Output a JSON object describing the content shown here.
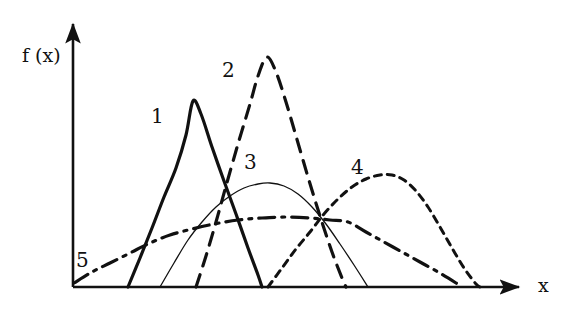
{
  "figure": {
    "background_color": "#ffffff",
    "ink_color": "#111111"
  },
  "axes": {
    "y_axis_label": "f (x)",
    "x_axis_label": "x",
    "origin": [
      73,
      287
    ],
    "x_axis_end": [
      525,
      287
    ],
    "y_axis_top": [
      73,
      18
    ],
    "arrows": "both",
    "ticks": "none",
    "gridlines": "none"
  },
  "chart_data": {
    "type": "line",
    "title": "",
    "xlabel": "x",
    "ylabel": "f (x)",
    "xlim": [
      0,
      1
    ],
    "ylim": [
      0,
      1
    ],
    "grid": false,
    "legend_position": "inline-labels",
    "series": [
      {
        "name": "1",
        "label": "1",
        "style": "solid-thick",
        "stroke_width": 3.2,
        "color": "#111111",
        "label_position": [
          151,
          106
        ],
        "points": [
          [
            128,
            287
          ],
          [
            140,
            258
          ],
          [
            152,
            228
          ],
          [
            164,
            197
          ],
          [
            176,
            168
          ],
          [
            186,
            135
          ],
          [
            193,
            101
          ],
          [
            201,
            114
          ],
          [
            212,
            147
          ],
          [
            224,
            181
          ],
          [
            236,
            214
          ],
          [
            248,
            248
          ],
          [
            258,
            275
          ],
          [
            262,
            287
          ]
        ]
      },
      {
        "name": "2",
        "label": "2",
        "style": "dashed-long",
        "stroke_width": 3.2,
        "dash_pattern": "13,9",
        "color": "#111111",
        "label_position": [
          222,
          60
        ],
        "points": [
          [
            196,
            287
          ],
          [
            206,
            256
          ],
          [
            216,
            222
          ],
          [
            226,
            186
          ],
          [
            238,
            144
          ],
          [
            250,
            104
          ],
          [
            258,
            76
          ],
          [
            267,
            57
          ],
          [
            276,
            72
          ],
          [
            286,
            102
          ],
          [
            296,
            136
          ],
          [
            308,
            177
          ],
          [
            320,
            216
          ],
          [
            332,
            252
          ],
          [
            342,
            278
          ],
          [
            346,
            287
          ]
        ]
      },
      {
        "name": "3",
        "label": "3",
        "style": "solid-thin",
        "stroke_width": 1.3,
        "color": "#111111",
        "label_position": [
          244,
          152
        ],
        "points": [
          [
            160,
            287
          ],
          [
            174,
            263
          ],
          [
            188,
            240
          ],
          [
            202,
            222
          ],
          [
            216,
            207
          ],
          [
            230,
            196
          ],
          [
            244,
            188
          ],
          [
            258,
            184
          ],
          [
            270,
            183
          ],
          [
            284,
            186
          ],
          [
            298,
            194
          ],
          [
            312,
            207
          ],
          [
            326,
            224
          ],
          [
            340,
            244
          ],
          [
            354,
            265
          ],
          [
            368,
            287
          ]
        ]
      },
      {
        "name": "4",
        "label": "4",
        "style": "dashed-short",
        "stroke_width": 3.0,
        "dash_pattern": "7,6",
        "color": "#111111",
        "label_position": [
          351,
          157
        ],
        "points": [
          [
            268,
            287
          ],
          [
            282,
            268
          ],
          [
            296,
            249
          ],
          [
            310,
            232
          ],
          [
            324,
            214
          ],
          [
            338,
            199
          ],
          [
            352,
            187
          ],
          [
            366,
            179
          ],
          [
            380,
            175
          ],
          [
            392,
            175
          ],
          [
            404,
            180
          ],
          [
            416,
            191
          ],
          [
            428,
            207
          ],
          [
            440,
            227
          ],
          [
            452,
            248
          ],
          [
            464,
            268
          ],
          [
            476,
            284
          ],
          [
            480,
            287
          ]
        ]
      },
      {
        "name": "5",
        "label": "5",
        "style": "dash-dot",
        "stroke_width": 3.2,
        "dash_pattern": "16,7,3,7",
        "color": "#111111",
        "label_position": [
          76,
          250
        ],
        "points": [
          [
            74,
            283
          ],
          [
            92,
            272
          ],
          [
            110,
            263
          ],
          [
            130,
            253
          ],
          [
            150,
            243
          ],
          [
            170,
            235
          ],
          [
            192,
            229
          ],
          [
            214,
            224
          ],
          [
            238,
            220
          ],
          [
            262,
            218
          ],
          [
            286,
            217
          ],
          [
            310,
            218
          ],
          [
            330,
            220
          ],
          [
            348,
            222
          ],
          [
            366,
            232
          ],
          [
            384,
            242
          ],
          [
            402,
            252
          ],
          [
            420,
            262
          ],
          [
            438,
            272
          ],
          [
            456,
            283
          ],
          [
            462,
            287
          ]
        ]
      }
    ]
  },
  "labels": {
    "curve_1": "1",
    "curve_2": "2",
    "curve_3": "3",
    "curve_4": "4",
    "curve_5": "5"
  }
}
